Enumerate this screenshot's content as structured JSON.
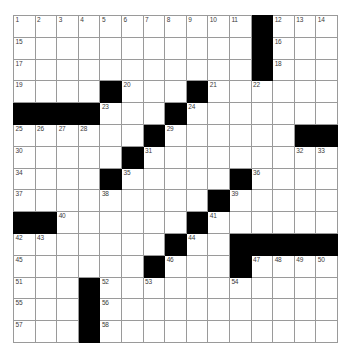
{
  "puzzle": {
    "title": "Crossword Grid",
    "type": "crossword-grid",
    "rows": 15,
    "cols": 15,
    "cell_size_px": 20.8,
    "colors": {
      "block_fill": "#000000",
      "cell_fill": "#ffffff",
      "grid_line": "#9a9a9a",
      "border": "#8c8c8c",
      "number_text": "#3b3b3b"
    },
    "grid": [
      [
        {
          "block": false,
          "num": "1"
        },
        {
          "block": false,
          "num": "2"
        },
        {
          "block": false,
          "num": "3"
        },
        {
          "block": false,
          "num": "4"
        },
        {
          "block": false,
          "num": "5"
        },
        {
          "block": false,
          "num": "6"
        },
        {
          "block": false,
          "num": "7"
        },
        {
          "block": false,
          "num": "8"
        },
        {
          "block": false,
          "num": "9"
        },
        {
          "block": false,
          "num": "10"
        },
        {
          "block": false,
          "num": "11"
        },
        {
          "block": true,
          "num": ""
        },
        {
          "block": false,
          "num": "12"
        },
        {
          "block": false,
          "num": "13"
        },
        {
          "block": false,
          "num": "14"
        }
      ],
      [
        {
          "block": false,
          "num": "15"
        },
        {
          "block": false,
          "num": ""
        },
        {
          "block": false,
          "num": ""
        },
        {
          "block": false,
          "num": ""
        },
        {
          "block": false,
          "num": ""
        },
        {
          "block": false,
          "num": ""
        },
        {
          "block": false,
          "num": ""
        },
        {
          "block": false,
          "num": ""
        },
        {
          "block": false,
          "num": ""
        },
        {
          "block": false,
          "num": ""
        },
        {
          "block": false,
          "num": ""
        },
        {
          "block": true,
          "num": ""
        },
        {
          "block": false,
          "num": "16"
        },
        {
          "block": false,
          "num": ""
        },
        {
          "block": false,
          "num": ""
        }
      ],
      [
        {
          "block": false,
          "num": "17"
        },
        {
          "block": false,
          "num": ""
        },
        {
          "block": false,
          "num": ""
        },
        {
          "block": false,
          "num": ""
        },
        {
          "block": false,
          "num": ""
        },
        {
          "block": false,
          "num": ""
        },
        {
          "block": false,
          "num": ""
        },
        {
          "block": false,
          "num": ""
        },
        {
          "block": false,
          "num": ""
        },
        {
          "block": false,
          "num": ""
        },
        {
          "block": false,
          "num": ""
        },
        {
          "block": true,
          "num": ""
        },
        {
          "block": false,
          "num": "18"
        },
        {
          "block": false,
          "num": ""
        },
        {
          "block": false,
          "num": ""
        }
      ],
      [
        {
          "block": false,
          "num": "19"
        },
        {
          "block": false,
          "num": ""
        },
        {
          "block": false,
          "num": ""
        },
        {
          "block": false,
          "num": ""
        },
        {
          "block": true,
          "num": ""
        },
        {
          "block": false,
          "num": "20"
        },
        {
          "block": false,
          "num": ""
        },
        {
          "block": false,
          "num": ""
        },
        {
          "block": true,
          "num": ""
        },
        {
          "block": false,
          "num": "21"
        },
        {
          "block": false,
          "num": ""
        },
        {
          "block": false,
          "num": "22"
        },
        {
          "block": false,
          "num": ""
        },
        {
          "block": false,
          "num": ""
        },
        {
          "block": false,
          "num": ""
        }
      ],
      [
        {
          "block": true,
          "num": ""
        },
        {
          "block": true,
          "num": ""
        },
        {
          "block": true,
          "num": ""
        },
        {
          "block": true,
          "num": ""
        },
        {
          "block": false,
          "num": "23"
        },
        {
          "block": false,
          "num": ""
        },
        {
          "block": false,
          "num": ""
        },
        {
          "block": true,
          "num": ""
        },
        {
          "block": false,
          "num": "24"
        },
        {
          "block": false,
          "num": ""
        },
        {
          "block": false,
          "num": ""
        },
        {
          "block": false,
          "num": ""
        },
        {
          "block": false,
          "num": ""
        },
        {
          "block": false,
          "num": ""
        },
        {
          "block": false,
          "num": ""
        }
      ],
      [
        {
          "block": false,
          "num": "25"
        },
        {
          "block": false,
          "num": "26"
        },
        {
          "block": false,
          "num": "27"
        },
        {
          "block": false,
          "num": "28"
        },
        {
          "block": false,
          "num": ""
        },
        {
          "block": false,
          "num": ""
        },
        {
          "block": true,
          "num": ""
        },
        {
          "block": false,
          "num": "29"
        },
        {
          "block": false,
          "num": ""
        },
        {
          "block": false,
          "num": ""
        },
        {
          "block": false,
          "num": ""
        },
        {
          "block": false,
          "num": ""
        },
        {
          "block": false,
          "num": ""
        },
        {
          "block": true,
          "num": ""
        },
        {
          "block": true,
          "num": ""
        }
      ],
      [
        {
          "block": false,
          "num": "30"
        },
        {
          "block": false,
          "num": ""
        },
        {
          "block": false,
          "num": ""
        },
        {
          "block": false,
          "num": ""
        },
        {
          "block": false,
          "num": ""
        },
        {
          "block": true,
          "num": ""
        },
        {
          "block": false,
          "num": "31"
        },
        {
          "block": false,
          "num": ""
        },
        {
          "block": false,
          "num": ""
        },
        {
          "block": false,
          "num": ""
        },
        {
          "block": false,
          "num": ""
        },
        {
          "block": false,
          "num": ""
        },
        {
          "block": false,
          "num": ""
        },
        {
          "block": false,
          "num": "32"
        },
        {
          "block": false,
          "num": "33"
        }
      ],
      [
        {
          "block": false,
          "num": "34"
        },
        {
          "block": false,
          "num": ""
        },
        {
          "block": false,
          "num": ""
        },
        {
          "block": false,
          "num": ""
        },
        {
          "block": true,
          "num": ""
        },
        {
          "block": false,
          "num": "35"
        },
        {
          "block": false,
          "num": ""
        },
        {
          "block": false,
          "num": ""
        },
        {
          "block": false,
          "num": ""
        },
        {
          "block": false,
          "num": ""
        },
        {
          "block": true,
          "num": ""
        },
        {
          "block": false,
          "num": "36"
        },
        {
          "block": false,
          "num": ""
        },
        {
          "block": false,
          "num": ""
        },
        {
          "block": false,
          "num": ""
        }
      ],
      [
        {
          "block": false,
          "num": "37"
        },
        {
          "block": false,
          "num": ""
        },
        {
          "block": false,
          "num": ""
        },
        {
          "block": false,
          "num": ""
        },
        {
          "block": false,
          "num": "38"
        },
        {
          "block": false,
          "num": ""
        },
        {
          "block": false,
          "num": ""
        },
        {
          "block": false,
          "num": ""
        },
        {
          "block": false,
          "num": ""
        },
        {
          "block": true,
          "num": ""
        },
        {
          "block": false,
          "num": "39"
        },
        {
          "block": false,
          "num": ""
        },
        {
          "block": false,
          "num": ""
        },
        {
          "block": false,
          "num": ""
        },
        {
          "block": false,
          "num": ""
        }
      ],
      [
        {
          "block": true,
          "num": ""
        },
        {
          "block": true,
          "num": ""
        },
        {
          "block": false,
          "num": "40"
        },
        {
          "block": false,
          "num": ""
        },
        {
          "block": false,
          "num": ""
        },
        {
          "block": false,
          "num": ""
        },
        {
          "block": false,
          "num": ""
        },
        {
          "block": false,
          "num": ""
        },
        {
          "block": true,
          "num": ""
        },
        {
          "block": false,
          "num": "41"
        },
        {
          "block": false,
          "num": ""
        },
        {
          "block": false,
          "num": ""
        },
        {
          "block": false,
          "num": ""
        },
        {
          "block": false,
          "num": ""
        },
        {
          "block": false,
          "num": ""
        }
      ],
      [
        {
          "block": false,
          "num": "42"
        },
        {
          "block": false,
          "num": "43"
        },
        {
          "block": false,
          "num": ""
        },
        {
          "block": false,
          "num": ""
        },
        {
          "block": false,
          "num": ""
        },
        {
          "block": false,
          "num": ""
        },
        {
          "block": false,
          "num": ""
        },
        {
          "block": true,
          "num": ""
        },
        {
          "block": false,
          "num": "44"
        },
        {
          "block": false,
          "num": ""
        },
        {
          "block": true,
          "num": ""
        },
        {
          "block": true,
          "num": ""
        },
        {
          "block": true,
          "num": ""
        },
        {
          "block": true,
          "num": ""
        },
        {
          "block": true,
          "num": ""
        }
      ],
      [
        {
          "block": false,
          "num": "45"
        },
        {
          "block": false,
          "num": ""
        },
        {
          "block": false,
          "num": ""
        },
        {
          "block": false,
          "num": ""
        },
        {
          "block": false,
          "num": ""
        },
        {
          "block": false,
          "num": ""
        },
        {
          "block": true,
          "num": ""
        },
        {
          "block": false,
          "num": "46"
        },
        {
          "block": false,
          "num": ""
        },
        {
          "block": false,
          "num": ""
        },
        {
          "block": true,
          "num": ""
        },
        {
          "block": false,
          "num": "47"
        },
        {
          "block": false,
          "num": "48"
        },
        {
          "block": false,
          "num": "49"
        },
        {
          "block": false,
          "num": "50"
        }
      ],
      [
        {
          "block": false,
          "num": "51"
        },
        {
          "block": false,
          "num": ""
        },
        {
          "block": false,
          "num": ""
        },
        {
          "block": true,
          "num": ""
        },
        {
          "block": false,
          "num": "52"
        },
        {
          "block": false,
          "num": ""
        },
        {
          "block": false,
          "num": "53"
        },
        {
          "block": false,
          "num": ""
        },
        {
          "block": false,
          "num": ""
        },
        {
          "block": false,
          "num": ""
        },
        {
          "block": false,
          "num": "54"
        },
        {
          "block": false,
          "num": ""
        },
        {
          "block": false,
          "num": ""
        },
        {
          "block": false,
          "num": ""
        },
        {
          "block": false,
          "num": ""
        }
      ],
      [
        {
          "block": false,
          "num": "55"
        },
        {
          "block": false,
          "num": ""
        },
        {
          "block": false,
          "num": ""
        },
        {
          "block": true,
          "num": ""
        },
        {
          "block": false,
          "num": "56"
        },
        {
          "block": false,
          "num": ""
        },
        {
          "block": false,
          "num": ""
        },
        {
          "block": false,
          "num": ""
        },
        {
          "block": false,
          "num": ""
        },
        {
          "block": false,
          "num": ""
        },
        {
          "block": false,
          "num": ""
        },
        {
          "block": false,
          "num": ""
        },
        {
          "block": false,
          "num": ""
        },
        {
          "block": false,
          "num": ""
        },
        {
          "block": false,
          "num": ""
        }
      ],
      [
        {
          "block": false,
          "num": "57"
        },
        {
          "block": false,
          "num": ""
        },
        {
          "block": false,
          "num": ""
        },
        {
          "block": true,
          "num": ""
        },
        {
          "block": false,
          "num": "58"
        },
        {
          "block": false,
          "num": ""
        },
        {
          "block": false,
          "num": ""
        },
        {
          "block": false,
          "num": ""
        },
        {
          "block": false,
          "num": ""
        },
        {
          "block": false,
          "num": ""
        },
        {
          "block": false,
          "num": ""
        },
        {
          "block": false,
          "num": ""
        },
        {
          "block": false,
          "num": ""
        },
        {
          "block": false,
          "num": ""
        },
        {
          "block": false,
          "num": ""
        }
      ]
    ]
  }
}
